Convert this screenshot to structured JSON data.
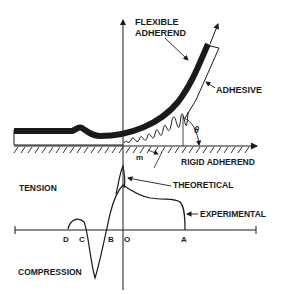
{
  "diagram": {
    "type": "peel-test-stress-distribution",
    "labels": {
      "flexible_adherend_line1": "FLEXIBLE",
      "flexible_adherend_line2": "ADHEREND",
      "adhesive": "ADHESIVE",
      "theta": "θ",
      "m": "m",
      "rigid_adherend": "RIGID ADHEREND",
      "tension": "TENSION",
      "theoretical": "THEORETICAL",
      "experimental": "EXPERIMENTAL",
      "compression": "COMPRESSION"
    },
    "axis_points": [
      {
        "id": "D",
        "label": "D"
      },
      {
        "id": "C",
        "label": "C"
      },
      {
        "id": "B",
        "label": "B"
      },
      {
        "id": "O",
        "label": "O"
      },
      {
        "id": "A",
        "label": "A"
      }
    ],
    "curves": [
      {
        "name": "theoretical",
        "label": "THEORETICAL"
      },
      {
        "name": "experimental",
        "label": "EXPERIMENTAL"
      }
    ],
    "colors": {
      "ink": "#1a1a1a",
      "background": "#ffffff"
    }
  }
}
